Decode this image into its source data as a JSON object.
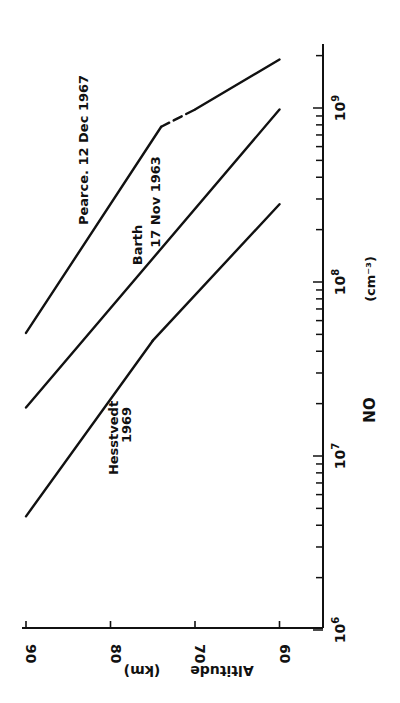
{
  "chart_data": {
    "type": "line",
    "orientation": "rotated 90 degrees (page printed sideways)",
    "title": "",
    "xlabel": "NO",
    "xlabel_units": "(cm⁻³)",
    "ylabel": "Altitude",
    "ylabel_units": "(km)",
    "x_scale": "log",
    "xlim": [
      1000000.0,
      2300000000.0
    ],
    "ylim": [
      55,
      90
    ],
    "x_ticks": [
      {
        "value": 1000000.0,
        "label": "10",
        "exp": "6"
      },
      {
        "value": 10000000.0,
        "label": "10",
        "exp": "7"
      },
      {
        "value": 100000000.0,
        "label": "10",
        "exp": "8"
      },
      {
        "value": 1000000000.0,
        "label": "10",
        "exp": "9"
      }
    ],
    "y_ticks": [
      {
        "value": 90,
        "label": "90"
      },
      {
        "value": 80,
        "label": "80"
      },
      {
        "value": 70,
        "label": "70"
      },
      {
        "value": 60,
        "label": "60"
      }
    ],
    "grid": false,
    "legend": "inline labels next to curves",
    "series": [
      {
        "name": "Pearce. 12 Dec 1967",
        "label_line1": "Pearce.  12 Dec 1967",
        "points": [
          {
            "altitude": 90,
            "no": 51000000.0
          },
          {
            "altitude": 74,
            "no": 780000000.0
          },
          {
            "altitude": 70,
            "no": 980000000.0,
            "segment": "dashed"
          },
          {
            "altitude": 60,
            "no": 1900000000.0
          }
        ]
      },
      {
        "name": "Barth 17 Nov 1963",
        "label_line1": "Barth",
        "label_line2": "17 Nov 1963",
        "points": [
          {
            "altitude": 90,
            "no": 19000000.0
          },
          {
            "altitude": 60,
            "no": 980000000.0
          }
        ]
      },
      {
        "name": "Hesstvedt 1969",
        "label_line1": "Hesstvedt",
        "label_line2": "1969",
        "points": [
          {
            "altitude": 90,
            "no": 4500000.0
          },
          {
            "altitude": 75,
            "no": 46000000.0
          },
          {
            "altitude": 60,
            "no": 280000000.0
          }
        ]
      }
    ]
  },
  "axis_labels": {
    "x_name": "NO",
    "x_units": "(cm⁻³)",
    "y_name": "Altitude",
    "y_units": "(km)"
  }
}
